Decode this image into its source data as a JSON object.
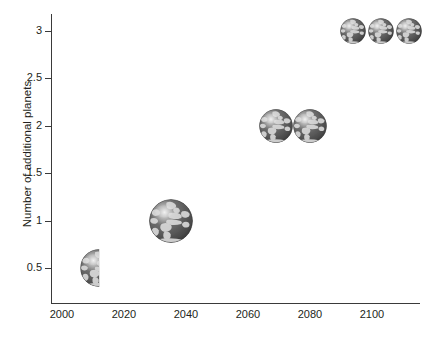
{
  "chart_data": {
    "type": "scatter",
    "title": "",
    "xlabel": "",
    "ylabel": "Number of additional planets",
    "xlim": [
      2000,
      2110
    ],
    "ylim": [
      0.25,
      3.15
    ],
    "grid": false,
    "legend": null,
    "marker_style": "earth-globe-image",
    "x_ticks": [
      "2000",
      "2020",
      "2040",
      "2060",
      "2080",
      "2100"
    ],
    "x_tick_values": [
      2000,
      2020,
      2040,
      2060,
      2080,
      2100
    ],
    "y_ticks": [
      "0.5",
      "1",
      "1.5",
      "2",
      "2.5",
      "3"
    ],
    "y_tick_values": [
      0.5,
      1,
      1.5,
      2,
      2.5,
      3
    ],
    "x": [
      2012,
      2035,
      2069,
      2080,
      2094,
      2103,
      2112
    ],
    "y": [
      0.5,
      1,
      2,
      2,
      3,
      3,
      3
    ],
    "points": [
      {
        "x": 2012,
        "y": 0.5,
        "marker": "half-globe",
        "radius_px": 19
      },
      {
        "x": 2035,
        "y": 1,
        "marker": "globe",
        "radius_px": 22
      },
      {
        "x": 2069,
        "y": 2,
        "marker": "globe",
        "radius_px": 17
      },
      {
        "x": 2080,
        "y": 2,
        "marker": "globe",
        "radius_px": 17
      },
      {
        "x": 2094,
        "y": 3,
        "marker": "globe",
        "radius_px": 13
      },
      {
        "x": 2103,
        "y": 3,
        "marker": "globe",
        "radius_px": 13
      },
      {
        "x": 2112,
        "y": 3,
        "marker": "globe",
        "radius_px": 13
      }
    ]
  },
  "axes": {
    "y_title": "Number of additional planets",
    "y_tick_labels": [
      {
        "text": "3",
        "top": 26
      },
      {
        "text": "2.5",
        "top": 74
      },
      {
        "text": "2",
        "top": 121
      },
      {
        "text": "1.5",
        "top": 169
      },
      {
        "text": "1",
        "top": 216
      },
      {
        "text": "0.5",
        "top": 263
      }
    ],
    "x_tick_labels": [
      {
        "text": "2000",
        "left": 40
      },
      {
        "text": "2020",
        "left": 102
      },
      {
        "text": "2040",
        "left": 164
      },
      {
        "text": "2060",
        "left": 226
      },
      {
        "text": "2080",
        "left": 288
      },
      {
        "text": "2100",
        "left": 350
      }
    ]
  },
  "colors": {
    "axis": "#3a3a3a",
    "text": "#231f20",
    "background": "#ffffff",
    "globe_ocean": "#6e6e6e",
    "globe_land": "#d8d8d8",
    "globe_shadow": "#3c3c3c",
    "globe_highlight": "#f0f0f0"
  },
  "markers": {
    "globe_icon_name": "earth-globe-icon",
    "half_globe_icon_name": "half-earth-globe-icon"
  }
}
